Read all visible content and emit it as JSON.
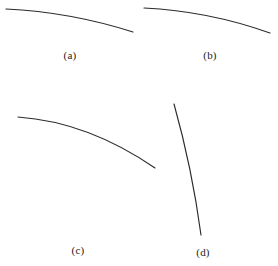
{
  "figure": {
    "width": 278,
    "height": 266,
    "background_color": "#ffffff",
    "stroke_color": "#2b2b2b",
    "label_color": "#222222",
    "panels": [
      {
        "label": "(a)",
        "label_x": 70,
        "label_y": 55,
        "curve_name": "curve-a",
        "path": "M 6 9 Q 70 12 133 32",
        "start": [
          6,
          9
        ],
        "end": [
          133,
          32
        ],
        "description": "shallow concave-down arc, upper-left panel"
      },
      {
        "label": "(b)",
        "label_x": 210,
        "label_y": 55,
        "curve_name": "curve-b",
        "path": "M 144 8 Q 208 11 270 33",
        "start": [
          144,
          8
        ],
        "end": [
          270,
          33
        ],
        "description": "shallow concave-down arc, upper-right panel"
      },
      {
        "label": "(c)",
        "label_x": 78,
        "label_y": 250,
        "curve_name": "curve-c",
        "path": "M 18 117 Q 88 122 155 168",
        "start": [
          18,
          117
        ],
        "end": [
          155,
          168
        ],
        "description": "steeper concave-down arc, lower-left panel"
      },
      {
        "label": "(d)",
        "label_x": 203,
        "label_y": 252,
        "curve_name": "curve-d",
        "path": "M 174 104 Q 192 168 201 235",
        "start": [
          174,
          104
        ],
        "end": [
          201,
          235
        ],
        "description": "near-vertical concave-right arc, lower-right panel"
      }
    ]
  }
}
